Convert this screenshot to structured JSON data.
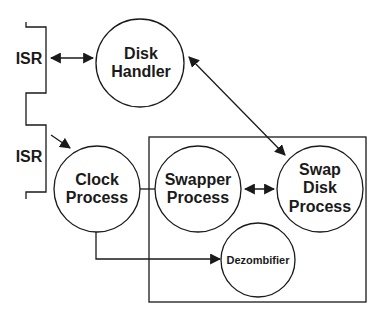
{
  "diagram": {
    "isr_labels": [
      "ISR",
      "ISR"
    ],
    "nodes": {
      "disk_handler": {
        "line1": "Disk",
        "line2": "Handler"
      },
      "clock_process": {
        "line1": "Clock",
        "line2": "Process"
      },
      "swapper_process": {
        "line1": "Swapper",
        "line2": "Process"
      },
      "swap_disk_process": {
        "line1": "Swap",
        "line2": "Disk",
        "line3": "Process"
      },
      "dezombifier": {
        "line1": "Dezombifier"
      }
    },
    "edges": [
      {
        "from": "ISR",
        "to": "Disk Handler",
        "type": "bidirectional"
      },
      {
        "from": "ISR",
        "to": "Clock Process",
        "type": "directed"
      },
      {
        "from": "Disk Handler",
        "to": "Swap Disk Process",
        "type": "bidirectional"
      },
      {
        "from": "Clock Process",
        "to": "Swapper Process",
        "type": "line"
      },
      {
        "from": "Swapper Process",
        "to": "Swap Disk Process",
        "type": "bidirectional"
      },
      {
        "from": "Clock Process",
        "to": "Dezombifier",
        "type": "directed"
      }
    ],
    "colors": {
      "stroke": "#1a1a1a",
      "background": "#ffffff"
    }
  }
}
